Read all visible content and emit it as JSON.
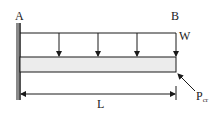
{
  "diagram": {
    "labels": {
      "fixed_end": "A",
      "free_end": "B",
      "load": "W",
      "length": "L",
      "critical_load": "P",
      "critical_load_sub": "cr"
    },
    "colors": {
      "line": "#1a1a1a",
      "beam_fill": "#ececec",
      "wall": "#8a8a8a"
    },
    "load_arrow_count": 4
  }
}
